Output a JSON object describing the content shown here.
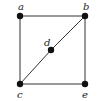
{
  "diagram": {
    "type": "graph",
    "colors": {
      "edge": "#333333",
      "node": "#111111",
      "label": "#222222",
      "background": "#ffffff"
    },
    "nodes": [
      {
        "id": "a",
        "label": "a",
        "x": 20,
        "y": 16,
        "lx": 18,
        "ly": 10
      },
      {
        "id": "b",
        "label": "b",
        "x": 85,
        "y": 16,
        "lx": 83,
        "ly": 10
      },
      {
        "id": "c",
        "label": "c",
        "x": 20,
        "y": 84,
        "lx": 17,
        "ly": 98
      },
      {
        "id": "d",
        "label": "d",
        "x": 51,
        "y": 50,
        "lx": 44,
        "ly": 46
      },
      {
        "id": "e",
        "label": "e",
        "x": 85,
        "y": 84,
        "lx": 82,
        "ly": 98
      }
    ],
    "edges": [
      {
        "from": "a",
        "to": "b"
      },
      {
        "from": "a",
        "to": "c"
      },
      {
        "from": "b",
        "to": "e"
      },
      {
        "from": "c",
        "to": "e"
      },
      {
        "from": "c",
        "to": "d"
      },
      {
        "from": "d",
        "to": "b"
      }
    ]
  }
}
